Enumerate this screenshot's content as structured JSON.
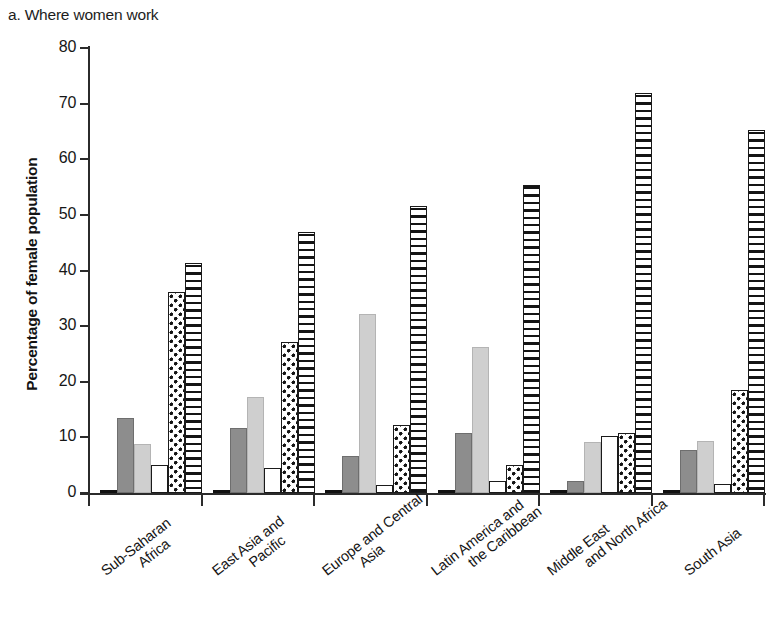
{
  "chart_data": {
    "type": "bar",
    "title": "a. Where women work",
    "xlabel": "",
    "ylabel": "Percentage of female population",
    "ylim": [
      0,
      80
    ],
    "ytick_labels": [
      "80",
      "70",
      "60",
      "50",
      "40",
      "30",
      "20",
      "10",
      "0"
    ],
    "ytick_values": [
      80,
      70,
      60,
      50,
      40,
      30,
      20,
      10,
      0
    ],
    "grid": false,
    "legend": "none",
    "categories": [
      "Sub-Saharan Africa",
      "East Asia and Pacific",
      "Europe and Central Asia",
      "Latin America and the Caribbean",
      "Middle East and North Africa",
      "South Asia"
    ],
    "category_lines": [
      [
        "Sub-Saharan",
        "Africa"
      ],
      [
        "East Asia and",
        "Pacific"
      ],
      [
        "Europe and Central",
        "Asia"
      ],
      [
        "Latin America and",
        "the Caribbean"
      ],
      [
        "Middle East",
        "and North Africa"
      ],
      [
        "South Asia",
        ""
      ]
    ],
    "series": [
      {
        "name": "series-1",
        "pattern": "solid-black",
        "values": [
          0.4,
          0.3,
          0.6,
          0.6,
          0.3,
          0.4
        ]
      },
      {
        "name": "series-2",
        "pattern": "solid-dark-gray",
        "values": [
          13.4,
          11.7,
          6.7,
          10.7,
          2.2,
          7.7
        ]
      },
      {
        "name": "series-3",
        "pattern": "solid-light-gray",
        "values": [
          8.8,
          17.2,
          32.1,
          26.3,
          9.2,
          9.3
        ]
      },
      {
        "name": "series-4",
        "pattern": "open-white",
        "values": [
          5.1,
          4.5,
          1.5,
          2.1,
          10.2,
          1.7
        ]
      },
      {
        "name": "series-5",
        "pattern": "dotted",
        "values": [
          36.2,
          27.2,
          12.2,
          5.1,
          10.8,
          18.6
        ]
      },
      {
        "name": "series-6",
        "pattern": "horizontal-stripe",
        "values": [
          41.3,
          46.9,
          51.6,
          55.4,
          72.0,
          65.2
        ]
      }
    ]
  }
}
